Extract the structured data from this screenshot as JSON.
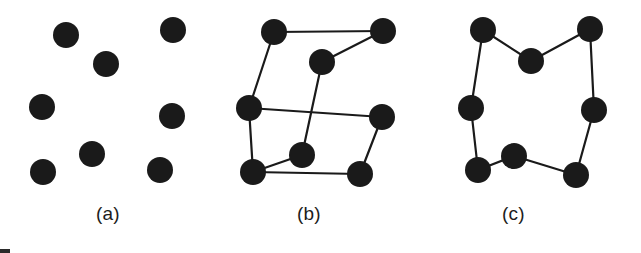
{
  "figure": {
    "width": 641,
    "height": 253,
    "background_color": "#ffffff",
    "node_color": "#1a1a1a",
    "edge_color": "#1a1a1a",
    "node_radius": 13,
    "edge_width": 2.2
  },
  "chart_data": {
    "type": "scatter",
    "title": "",
    "xlabel": "",
    "ylabel": "",
    "grid": false,
    "legend": false,
    "panels": [
      {
        "id": "a",
        "label": "(a)",
        "description": "Disordered gas-like arrangement: nine isolated particles with no bonds",
        "node_count": 9,
        "edge_count": 0,
        "nodes": [
          {
            "id": "a1",
            "x": 66,
            "y": 35
          },
          {
            "id": "a2",
            "x": 106,
            "y": 64
          },
          {
            "id": "a3",
            "x": 173,
            "y": 30
          },
          {
            "id": "a4",
            "x": 42,
            "y": 107
          },
          {
            "id": "a5",
            "x": 172,
            "y": 116
          },
          {
            "id": "a6",
            "x": 92,
            "y": 154
          },
          {
            "id": "a7",
            "x": 43,
            "y": 172
          },
          {
            "id": "a8",
            "x": 160,
            "y": 170
          }
        ],
        "edges": []
      },
      {
        "id": "b",
        "label": "(b)",
        "description": "Partially ordered arrangement: eight particles with crossing and incomplete bonds",
        "node_count": 8,
        "edge_count": 9,
        "nodes": [
          {
            "id": "b1",
            "x": 274,
            "y": 32
          },
          {
            "id": "b2",
            "x": 383,
            "y": 31
          },
          {
            "id": "b3",
            "x": 322,
            "y": 62
          },
          {
            "id": "b4",
            "x": 249,
            "y": 108
          },
          {
            "id": "b5",
            "x": 382,
            "y": 117
          },
          {
            "id": "b6",
            "x": 302,
            "y": 155
          },
          {
            "id": "b7",
            "x": 253,
            "y": 172
          },
          {
            "id": "b8",
            "x": 360,
            "y": 174
          }
        ],
        "edges": [
          [
            "b1",
            "b2"
          ],
          [
            "b2",
            "b3"
          ],
          [
            "b1",
            "b4"
          ],
          [
            "b3",
            "b6"
          ],
          [
            "b4",
            "b5"
          ],
          [
            "b5",
            "b8"
          ],
          [
            "b6",
            "b7"
          ],
          [
            "b7",
            "b8"
          ],
          [
            "b4",
            "b7"
          ]
        ]
      },
      {
        "id": "c",
        "label": "(c)",
        "description": "Ordered crystalline arrangement: eight particles bonded in a closed ring",
        "node_count": 8,
        "edge_count": 8,
        "nodes": [
          {
            "id": "c1",
            "x": 483,
            "y": 30
          },
          {
            "id": "c2",
            "x": 531,
            "y": 61
          },
          {
            "id": "c3",
            "x": 590,
            "y": 29
          },
          {
            "id": "c4",
            "x": 471,
            "y": 108
          },
          {
            "id": "c5",
            "x": 594,
            "y": 110
          },
          {
            "id": "c6",
            "x": 478,
            "y": 170
          },
          {
            "id": "c7",
            "x": 514,
            "y": 156
          },
          {
            "id": "c8",
            "x": 576,
            "y": 175
          }
        ],
        "edges": [
          [
            "c1",
            "c2"
          ],
          [
            "c2",
            "c3"
          ],
          [
            "c3",
            "c5"
          ],
          [
            "c5",
            "c8"
          ],
          [
            "c8",
            "c7"
          ],
          [
            "c7",
            "c6"
          ],
          [
            "c6",
            "c4"
          ],
          [
            "c4",
            "c1"
          ]
        ]
      }
    ]
  },
  "captions": {
    "a": "(a)",
    "b": "(b)",
    "c": "(c)"
  }
}
